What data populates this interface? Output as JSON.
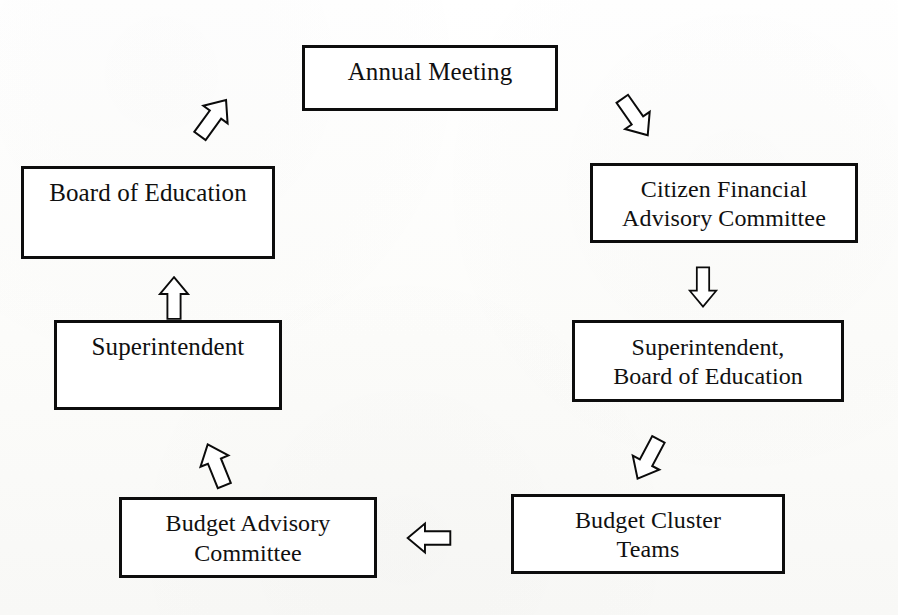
{
  "diagram": {
    "type": "cycle-flowchart",
    "background_color": "#fdfdfb",
    "box_border_color": "#0d0d0d",
    "box_fill_color": "#ffffff",
    "arrow_fill_color": "#ffffff",
    "arrow_outline_color": "#0b0b0b",
    "nodes": [
      {
        "id": "annual-meeting",
        "label": "Annual Meeting"
      },
      {
        "id": "board-of-education",
        "label": "Board of Education"
      },
      {
        "id": "citizen-financial",
        "label": "Citizen Financial\nAdvisory Committee"
      },
      {
        "id": "superintendent",
        "label": "Superintendent"
      },
      {
        "id": "supt-board",
        "label": "Superintendent,\nBoard of Education"
      },
      {
        "id": "budget-advisory",
        "label": "Budget Advisory\nCommittee"
      },
      {
        "id": "budget-cluster",
        "label": "Budget Cluster\nTeams"
      }
    ],
    "arrows": [
      {
        "id": "advisory-to-annual",
        "from": "board-of-education",
        "to": "annual-meeting",
        "direction": "up-right",
        "style": "hollow-block"
      },
      {
        "id": "annual-to-citizen",
        "from": "annual-meeting",
        "to": "citizen-financial",
        "direction": "down-right",
        "style": "hollow-block"
      },
      {
        "id": "citizen-to-supt",
        "from": "citizen-financial",
        "to": "supt-board",
        "direction": "down",
        "style": "hollow-block"
      },
      {
        "id": "supt-to-cluster",
        "from": "supt-board",
        "to": "budget-cluster",
        "direction": "down-left",
        "style": "hollow-block"
      },
      {
        "id": "cluster-to-advisory",
        "from": "budget-cluster",
        "to": "budget-advisory",
        "direction": "left",
        "style": "hollow-block"
      },
      {
        "id": "advisory-to-supt",
        "from": "budget-advisory",
        "to": "superintendent",
        "direction": "up",
        "style": "hollow-block"
      },
      {
        "id": "supt-to-board",
        "from": "superintendent",
        "to": "board-of-education",
        "direction": "up",
        "style": "hollow-block"
      }
    ]
  }
}
